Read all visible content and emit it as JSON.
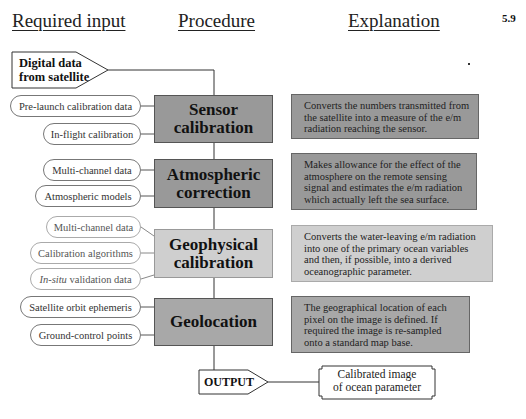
{
  "header": {
    "required_input": "Required input",
    "procedure": "Procedure",
    "explanation": "Explanation",
    "figure_number": "5.9"
  },
  "start": {
    "line1": "Digital data",
    "line2": "from satellite"
  },
  "steps": [
    {
      "title_line1": "Sensor",
      "title_line2": "calibration",
      "inputs": [
        "Pre-launch calibration data",
        "In-flight calibration"
      ],
      "explanation": "Converts the numbers transmitted from the satellite into a measure of the e/m radiation reaching the sensor."
    },
    {
      "title_line1": "Atmospheric",
      "title_line2": "correction",
      "inputs": [
        "Multi-channel data",
        "Atmospheric models"
      ],
      "explanation": "Makes allowance for the effect of the atmosphere on the remote sensing signal and estimates the e/m radiation which actually left  the sea surface."
    },
    {
      "title_line1": "Geophysical",
      "title_line2": "calibration",
      "inputs": [
        "Multi-channel data",
        "Calibration algorithms"
      ],
      "input3_italic": "In-situ",
      "input3_rest": " validation data",
      "explanation": "Converts the water-leaving e/m radiation into one of the primary ocean variables and then, if possible, into a derived oceanographic parameter."
    },
    {
      "title_line1": "Geolocation",
      "title_line2": "",
      "inputs": [
        "Satellite orbit ephemeris",
        "Ground-control points"
      ],
      "explanation": "The geographical location of each pixel on the image is defined. If required the image is re-sampled onto a standard map base."
    }
  ],
  "output": {
    "label": "OUTPUT",
    "result_line1": "Calibrated image",
    "result_line2": "of ocean parameter"
  },
  "colors": {
    "sensor_fill": "#999999",
    "atmospheric_fill": "#999999",
    "geophysical_fill": "#cfcfcf",
    "geolocation_fill": "#a8a8a8"
  }
}
